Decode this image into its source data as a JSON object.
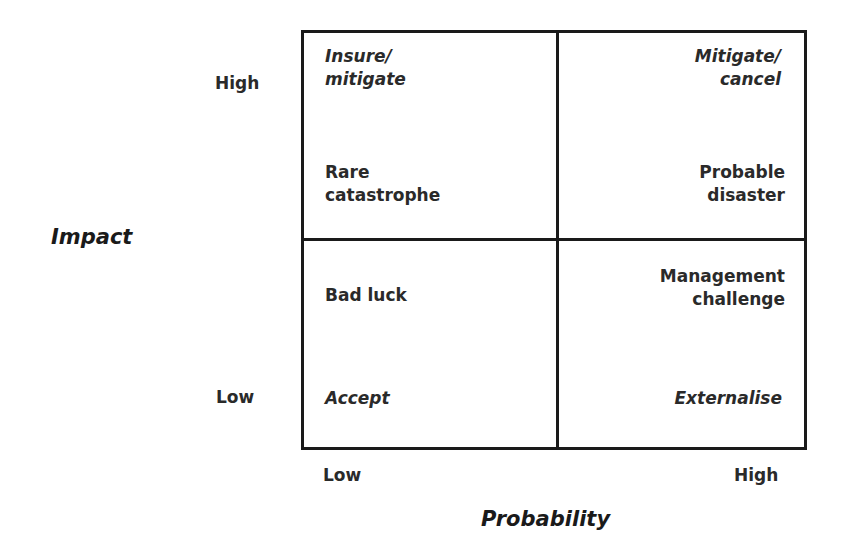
{
  "axes": {
    "y": {
      "title": "Impact",
      "high": "High",
      "low": "Low"
    },
    "x": {
      "title": "Probability",
      "low": "Low",
      "high": "High"
    }
  },
  "quadrants": {
    "high_impact_low_probability": {
      "strategy": "Insure/\nmitigate",
      "label": "Rare\ncatastrophe"
    },
    "high_impact_high_probability": {
      "strategy": "Mitigate/\ncancel",
      "label": "Probable\ndisaster"
    },
    "low_impact_low_probability": {
      "label": "Bad luck",
      "strategy": "Accept"
    },
    "low_impact_high_probability": {
      "label": "Management\nchallenge",
      "strategy": "Externalise"
    }
  },
  "colors": {
    "line": "#1a1a1a",
    "text": "#2a2a2a",
    "background": "#ffffff"
  }
}
